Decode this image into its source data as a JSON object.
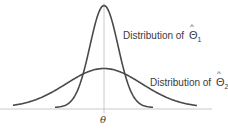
{
  "diagram": {
    "type": "overlapping-normal-distributions",
    "labels": {
      "dist1_prefix": "Distribution of",
      "dist1_symbol": "Θ",
      "dist1_hat": "^",
      "dist1_sub": "1",
      "dist2_prefix": "Distribution of",
      "dist2_symbol": "Θ",
      "dist2_hat": "^",
      "dist2_sub": "2",
      "x_center": "θ"
    },
    "colors": {
      "curve": "#4a4a4a",
      "axis": "#bdbdbd",
      "text": "#3a3a3a"
    },
    "curves": [
      {
        "name": "narrow",
        "peak_y": 7,
        "center_x": 104,
        "sigma_px": 14,
        "tail_left": 55,
        "tail_right": 153
      },
      {
        "name": "wide",
        "peak_y": 70,
        "center_x": 104,
        "sigma_px": 38,
        "tail_left": 13,
        "tail_right": 197
      }
    ]
  }
}
